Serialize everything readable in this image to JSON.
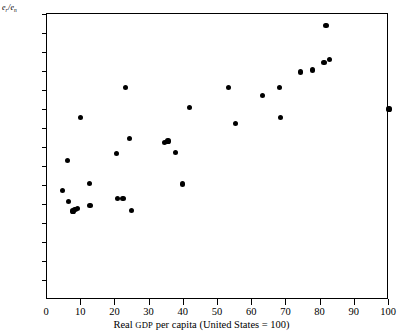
{
  "chart_data": {
    "type": "scatter",
    "title": "",
    "xlabel": "Real GDP per capita (United States = 100)",
    "ylabel": "e_r/e_n",
    "ylabel_parts": {
      "num_base": "e",
      "num_sub": "r",
      "slash": "/",
      "den_base": "e",
      "den_sub": "n"
    },
    "xlim": [
      0,
      100
    ],
    "ylim": [
      0,
      1.5
    ],
    "grid": false,
    "legend": null,
    "xticks": [
      0,
      10,
      20,
      30,
      40,
      50,
      60,
      70,
      80,
      90,
      100
    ],
    "xtick_labels": [
      "0",
      "10",
      "20",
      "30",
      "40",
      "50",
      "60",
      "70",
      "80",
      "90",
      "100"
    ],
    "yticks": [
      0.1,
      0.2,
      0.3,
      0.4,
      0.5,
      0.6,
      0.7,
      0.8,
      0.9,
      1.0,
      1.1,
      1.2,
      1.3,
      1.4,
      1.5
    ],
    "ytick_labels": [
      "0.1",
      "0.2",
      "0.3",
      "0.4",
      "0.5",
      "0.6",
      "0.7",
      "0.8",
      "0.9",
      "1.0",
      "1.1",
      "1.2",
      "1.3",
      "1.4",
      "1.5"
    ],
    "marker": "filled-circle",
    "marker_color": "#000000",
    "points": [
      {
        "x": 4.5,
        "y": 0.57
      },
      {
        "x": 6.0,
        "y": 0.728
      },
      {
        "x": 6.2,
        "y": 0.515
      },
      {
        "x": 7.6,
        "y": 0.463
      },
      {
        "x": 8.2,
        "y": 0.47
      },
      {
        "x": 8.8,
        "y": 0.478
      },
      {
        "x": 9.7,
        "y": 0.955
      },
      {
        "x": 12.4,
        "y": 0.61
      },
      {
        "x": 12.6,
        "y": 0.49
      },
      {
        "x": 20.4,
        "y": 0.765
      },
      {
        "x": 20.6,
        "y": 0.528
      },
      {
        "x": 22.2,
        "y": 0.528
      },
      {
        "x": 23.0,
        "y": 1.115
      },
      {
        "x": 24.2,
        "y": 0.845
      },
      {
        "x": 24.6,
        "y": 0.465
      },
      {
        "x": 34.4,
        "y": 0.825
      },
      {
        "x": 35.4,
        "y": 0.832
      },
      {
        "x": 37.6,
        "y": 0.77
      },
      {
        "x": 39.6,
        "y": 0.605
      },
      {
        "x": 41.6,
        "y": 1.01
      },
      {
        "x": 53.0,
        "y": 1.115
      },
      {
        "x": 55.2,
        "y": 0.922
      },
      {
        "x": 63.0,
        "y": 1.072
      },
      {
        "x": 68.0,
        "y": 1.115
      },
      {
        "x": 68.2,
        "y": 0.955
      },
      {
        "x": 74.2,
        "y": 1.195
      },
      {
        "x": 77.6,
        "y": 1.205
      },
      {
        "x": 81.0,
        "y": 1.245
      },
      {
        "x": 81.6,
        "y": 1.44
      },
      {
        "x": 82.6,
        "y": 1.26
      },
      {
        "x": 100.0,
        "y": 1.0
      }
    ]
  }
}
